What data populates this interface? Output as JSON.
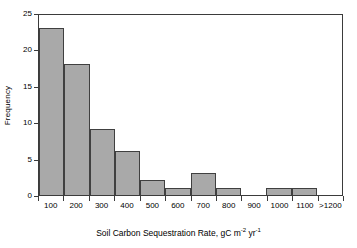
{
  "chart_data": {
    "type": "bar",
    "title": "",
    "subtitle": "",
    "xlabel": "Soil Carbon Sequestration Rate, gC m-2 yr-1",
    "xlabel_parts": {
      "main": "Soil Carbon Sequestration Rate, gC m",
      "sup1": "-2",
      "mid": " yr",
      "sup2": "-1"
    },
    "ylabel": "Frequency",
    "categories": [
      "100",
      "200",
      "300",
      "400",
      "500",
      "600",
      "700",
      "800",
      "900",
      "1000",
      "1100",
      ">1200"
    ],
    "values": [
      23,
      18,
      9,
      6,
      2,
      1,
      3,
      1,
      0,
      1,
      1,
      0
    ],
    "ylim": [
      0,
      25
    ],
    "yticks": [
      0,
      5,
      10,
      15,
      20,
      25
    ],
    "ytick_labels": [
      "0",
      "5",
      "10",
      "15",
      "20",
      "25"
    ],
    "grid": false,
    "legend": "none",
    "bar_fill_color": "#a9a9a9",
    "bar_edge_color": "#404040",
    "axis_color": "#3b3b3b",
    "background_color": "#ffffff"
  }
}
